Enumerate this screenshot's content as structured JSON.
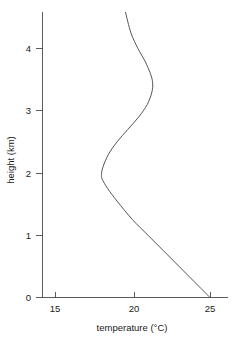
{
  "chart_data": {
    "type": "line",
    "title": "",
    "xlabel": "temperature (°C)",
    "ylabel": "height (km)",
    "xlim": [
      14.2,
      26.2
    ],
    "ylim": [
      0,
      4.58
    ],
    "grid": false,
    "legend": "none",
    "xticks": [
      15,
      20,
      25
    ],
    "xtick_labels": [
      "15",
      "20",
      "25"
    ],
    "yticks": [
      0,
      1,
      2,
      3,
      4
    ],
    "ytick_labels": [
      "0",
      "1",
      "2",
      "3",
      "4"
    ],
    "series": [
      {
        "name": "temperature profile",
        "color": "#555555",
        "x_label": "temperature (°C)",
        "y_label": "height (km)",
        "x": [
          25.0,
          24.0,
          23.0,
          22.0,
          21.0,
          20.0,
          19.0,
          18.4,
          18.05,
          18.0,
          18.1,
          18.45,
          19.0,
          19.7,
          20.4,
          20.95,
          21.25,
          21.3,
          21.15,
          20.8,
          20.35,
          19.9,
          19.55
        ],
        "y": [
          0.0,
          0.25,
          0.5,
          0.75,
          1.0,
          1.25,
          1.55,
          1.75,
          1.9,
          1.98,
          2.1,
          2.3,
          2.5,
          2.7,
          2.9,
          3.1,
          3.3,
          3.45,
          3.6,
          3.8,
          4.0,
          4.25,
          4.58
        ]
      }
    ],
    "annotations": []
  },
  "axis": {
    "x_title": "temperature (°C)",
    "y_title": "height (km)"
  }
}
